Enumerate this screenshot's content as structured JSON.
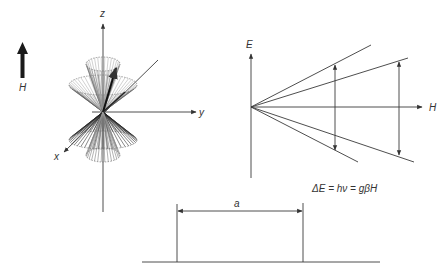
{
  "field_arrow": {
    "label": "H",
    "icon": "thick-up-arrow-icon"
  },
  "precession_diagram": {
    "axis_labels": {
      "z": "z",
      "y": "y",
      "x": "x"
    },
    "description": "Spin vectors precessing on cones about the z axis (field direction)"
  },
  "zeeman_diagram": {
    "axis_labels": {
      "vertical": "E",
      "horizontal": "H"
    },
    "level_lines": 4,
    "transition_arrows": 2
  },
  "equation": "ΔE = hν = gβH",
  "bottom_diagram": {
    "dimension_label": "a"
  }
}
